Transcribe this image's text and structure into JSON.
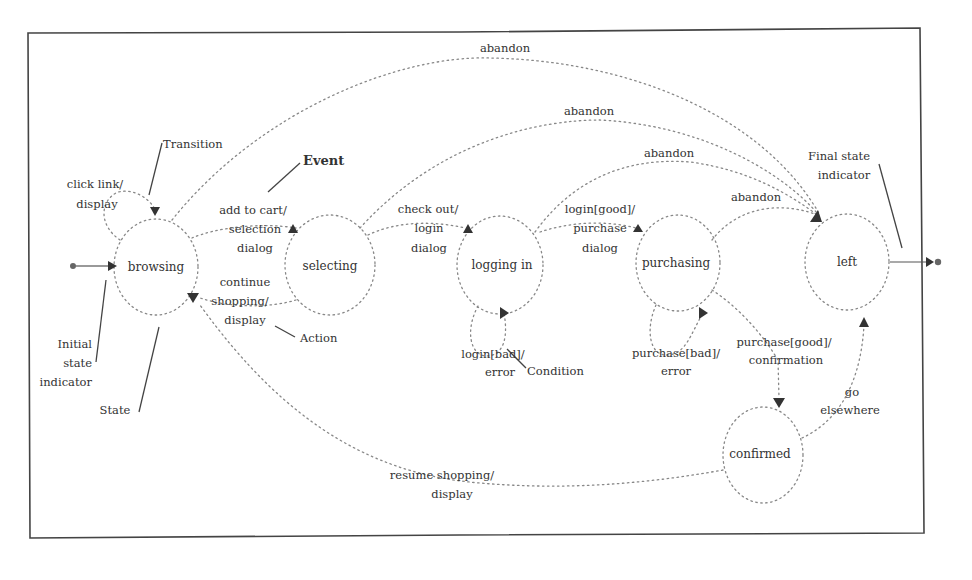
{
  "diagram": {
    "type": "state-transition",
    "states": {
      "browsing": "browsing",
      "selecting": "selecting",
      "logging_in": "logging in",
      "purchasing": "purchasing",
      "left": "left",
      "confirmed": "confirmed"
    },
    "transitions": {
      "click_link": [
        "click link/",
        "display"
      ],
      "add_to_cart": [
        "add to cart/",
        "selection",
        "dialog"
      ],
      "continue_shopping": [
        "continue",
        "shopping/",
        "display"
      ],
      "check_out": [
        "check out/",
        "login",
        "dialog"
      ],
      "login_good": [
        "login[good]/",
        "purchase",
        "dialog"
      ],
      "login_bad": [
        "login[bad]/",
        "error"
      ],
      "purchase_bad": [
        "purchase[bad]/",
        "error"
      ],
      "purchase_good": [
        "purchase[good]/",
        "confirmation"
      ],
      "go_elsewhere": [
        "go",
        "elsewhere"
      ],
      "resume_shopping": [
        "resume shopping/",
        "display"
      ],
      "abandon_1": "abandon",
      "abandon_2": "abandon",
      "abandon_3": "abandon",
      "abandon_4": "abandon"
    },
    "annotations": {
      "transition": "Transition",
      "event": "Event",
      "action": "Action",
      "condition": "Condition",
      "state": "State",
      "initial_state": [
        "Initial",
        "state",
        "indicator"
      ],
      "final_state": [
        "Final state",
        "indicator"
      ]
    }
  }
}
